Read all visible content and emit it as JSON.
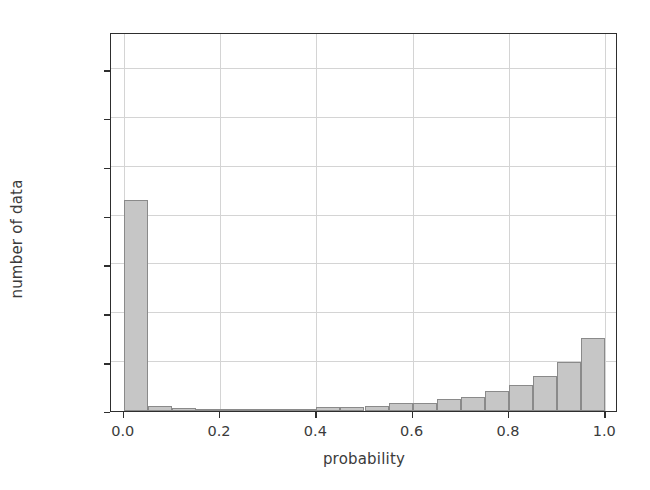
{
  "chart_data": {
    "type": "bar",
    "title": "",
    "xlabel": "probability",
    "ylabel": "number of data",
    "xlim": [
      -0.0265,
      1.0265
    ],
    "ylim": [
      0,
      19400
    ],
    "grid": true,
    "legend": null,
    "bin_width": 0.05,
    "bin_edges": [
      0.0,
      0.05,
      0.1,
      0.15,
      0.2,
      0.25,
      0.3,
      0.35,
      0.4,
      0.45,
      0.5,
      0.55,
      0.6,
      0.65,
      0.7,
      0.75,
      0.8,
      0.85,
      0.9,
      0.95,
      1.0
    ],
    "categories": [
      "0.00-0.05",
      "0.05-0.10",
      "0.10-0.15",
      "0.15-0.20",
      "0.20-0.25",
      "0.25-0.30",
      "0.30-0.35",
      "0.35-0.40",
      "0.40-0.45",
      "0.45-0.50",
      "0.50-0.55",
      "0.55-0.60",
      "0.60-0.65",
      "0.65-0.70",
      "0.70-0.75",
      "0.75-0.80",
      "0.80-0.85",
      "0.85-0.90",
      "0.90-0.95",
      "0.95-1.00"
    ],
    "values": [
      10800,
      250,
      130,
      90,
      80,
      80,
      90,
      100,
      200,
      190,
      280,
      390,
      420,
      600,
      720,
      1000,
      1350,
      1800,
      2500,
      3750
    ],
    "peak_value": 18300,
    "bar_color": "#c6c6c6",
    "bar_edge_color": "#8a8a8a",
    "xticks": [
      {
        "value": 0.0,
        "label": "0.0"
      },
      {
        "value": 0.2,
        "label": "0.2"
      },
      {
        "value": 0.4,
        "label": "0.4"
      },
      {
        "value": 0.6,
        "label": "0.6"
      },
      {
        "value": 0.8,
        "label": "0.8"
      },
      {
        "value": 1.0,
        "label": "1.0"
      }
    ],
    "yticks": [
      {
        "value": 0,
        "label": "0"
      },
      {
        "value": 2500,
        "label": "2500"
      },
      {
        "value": 5000,
        "label": "5000"
      },
      {
        "value": 7500,
        "label": "7500"
      },
      {
        "value": 10000,
        "label": "10000"
      },
      {
        "value": 12500,
        "label": "12500"
      },
      {
        "value": 15000,
        "label": "15000"
      },
      {
        "value": 17500,
        "label": "17500"
      }
    ]
  }
}
